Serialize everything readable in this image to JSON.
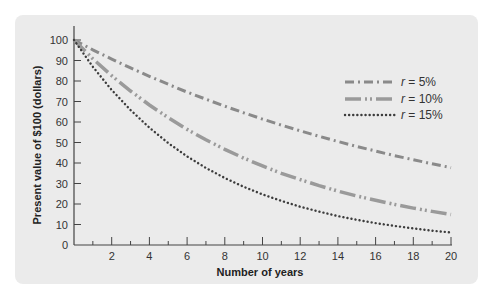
{
  "chart_data": {
    "type": "line",
    "title": "",
    "xlabel": "Number of years",
    "ylabel": "Present value of $100 (dollars)",
    "xlim": [
      0,
      20
    ],
    "ylim": [
      0,
      100
    ],
    "x_ticks": [
      2,
      4,
      6,
      8,
      10,
      12,
      14,
      16,
      18,
      20
    ],
    "x_minor_ticks": [
      1,
      3,
      5,
      7,
      9,
      11,
      13,
      15,
      17,
      19
    ],
    "y_ticks": [
      0,
      10,
      20,
      30,
      40,
      50,
      60,
      70,
      80,
      90,
      100
    ],
    "grid": false,
    "legend_position": "upper right",
    "x": [
      0,
      1,
      2,
      3,
      4,
      5,
      6,
      7,
      8,
      9,
      10,
      11,
      12,
      13,
      14,
      15,
      16,
      17,
      18,
      19,
      20
    ],
    "series": [
      {
        "name": "r = 5%",
        "style": "dash-dot",
        "values": [
          100,
          95.2,
          90.7,
          86.4,
          82.3,
          78.4,
          74.6,
          71.1,
          67.7,
          64.5,
          61.4,
          58.5,
          55.7,
          53.0,
          50.5,
          48.1,
          45.8,
          43.6,
          41.6,
          39.6,
          37.7
        ]
      },
      {
        "name": "r = 10%",
        "style": "long-dash-dot-dot",
        "values": [
          100,
          90.9,
          82.6,
          75.1,
          68.3,
          62.1,
          56.4,
          51.3,
          46.7,
          42.4,
          38.6,
          35.0,
          31.9,
          29.0,
          26.3,
          23.9,
          21.8,
          19.8,
          18.0,
          16.4,
          14.9
        ]
      },
      {
        "name": "r = 15%",
        "style": "dotted",
        "values": [
          100,
          87.0,
          75.6,
          65.8,
          57.2,
          49.7,
          43.2,
          37.6,
          32.7,
          28.4,
          24.7,
          21.5,
          18.7,
          16.3,
          14.1,
          12.3,
          10.7,
          9.3,
          8.1,
          7.0,
          6.1
        ]
      }
    ]
  },
  "legend": [
    {
      "prefix": "r",
      "suffix": " = 5%"
    },
    {
      "prefix": "r",
      "suffix": " = 10%"
    },
    {
      "prefix": "r",
      "suffix": " = 15%"
    }
  ],
  "colors": {
    "panel": "#ebebeb",
    "axis": "#444444",
    "line_5": "#8a8a8a",
    "line_10": "#9a9a9a",
    "line_15": "#3c3c3c"
  }
}
